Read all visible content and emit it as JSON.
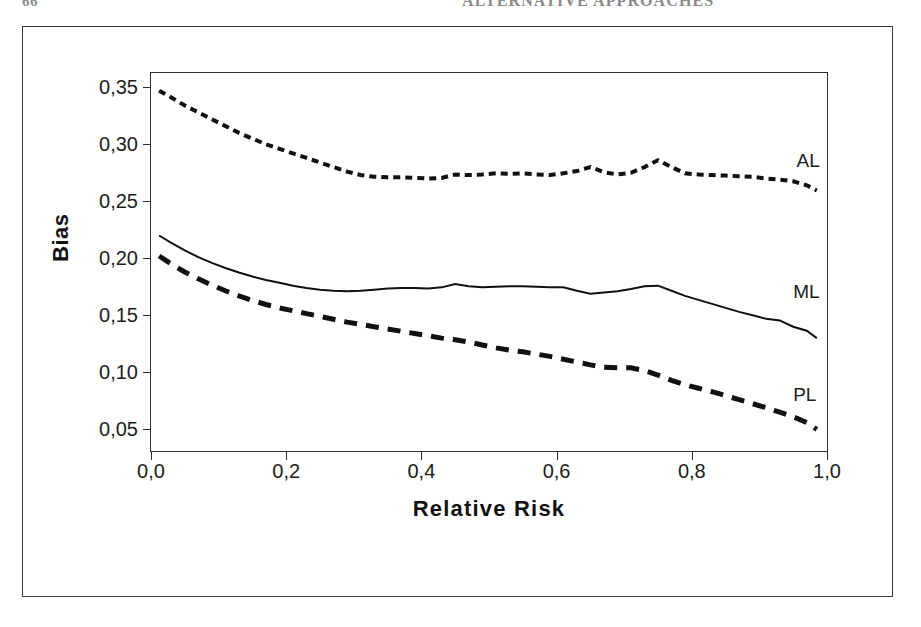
{
  "page": {
    "folio": "66",
    "running_head": "ALTERNATIVE APPROACHES"
  },
  "chart_data": {
    "type": "line",
    "title": "",
    "xlabel": "Relative Risk",
    "ylabel": "Bias",
    "xlim": [
      0.0,
      1.0
    ],
    "ylim": [
      0.031,
      0.3625
    ],
    "grid": false,
    "legend_position": "inline-right-of-curve",
    "xtick_labels": [
      "0,0",
      "0,2",
      "0,4",
      "0,6",
      "0,8",
      "1,0"
    ],
    "xtick_values": [
      0.0,
      0.2,
      0.4,
      0.6,
      0.8,
      1.0
    ],
    "ytick_labels": [
      "0,05",
      "0,10",
      "0,15",
      "0,20",
      "0,25",
      "0,30",
      "0,35"
    ],
    "ytick_values": [
      0.05,
      0.1,
      0.15,
      0.2,
      0.25,
      0.3,
      0.35
    ],
    "decimal_separator": ",",
    "series": [
      {
        "name": "AL",
        "label": "AL",
        "style": "dotted",
        "color": "#111111",
        "width": 4.0,
        "dash": "7,5",
        "label_x": 0.955,
        "label_y": 0.2855,
        "x": [
          0.012,
          0.03,
          0.05,
          0.07,
          0.09,
          0.11,
          0.13,
          0.15,
          0.17,
          0.19,
          0.21,
          0.23,
          0.25,
          0.27,
          0.29,
          0.31,
          0.33,
          0.35,
          0.37,
          0.39,
          0.41,
          0.43,
          0.45,
          0.47,
          0.49,
          0.51,
          0.53,
          0.55,
          0.57,
          0.59,
          0.61,
          0.63,
          0.65,
          0.67,
          0.69,
          0.71,
          0.73,
          0.75,
          0.77,
          0.79,
          0.81,
          0.83,
          0.85,
          0.87,
          0.89,
          0.91,
          0.93,
          0.95,
          0.97,
          0.985
        ],
        "y": [
          0.347,
          0.341,
          0.334,
          0.328,
          0.322,
          0.316,
          0.31,
          0.305,
          0.3,
          0.296,
          0.292,
          0.288,
          0.284,
          0.28,
          0.276,
          0.273,
          0.2715,
          0.271,
          0.271,
          0.2705,
          0.27,
          0.2705,
          0.2735,
          0.273,
          0.2735,
          0.2745,
          0.274,
          0.2745,
          0.2735,
          0.273,
          0.2745,
          0.2765,
          0.28,
          0.2755,
          0.2735,
          0.275,
          0.28,
          0.286,
          0.28,
          0.2745,
          0.2735,
          0.273,
          0.2725,
          0.272,
          0.2715,
          0.27,
          0.269,
          0.2675,
          0.264,
          0.2595
        ]
      },
      {
        "name": "ML",
        "label": "ML",
        "style": "solid",
        "color": "#111111",
        "width": 2.0,
        "dash": "none",
        "label_x": 0.95,
        "label_y": 0.1705,
        "x": [
          0.012,
          0.03,
          0.05,
          0.07,
          0.09,
          0.11,
          0.13,
          0.15,
          0.17,
          0.19,
          0.21,
          0.23,
          0.25,
          0.27,
          0.29,
          0.31,
          0.33,
          0.35,
          0.37,
          0.39,
          0.41,
          0.43,
          0.45,
          0.47,
          0.49,
          0.51,
          0.53,
          0.55,
          0.57,
          0.59,
          0.61,
          0.63,
          0.65,
          0.67,
          0.69,
          0.71,
          0.73,
          0.75,
          0.77,
          0.79,
          0.81,
          0.83,
          0.85,
          0.87,
          0.89,
          0.91,
          0.93,
          0.95,
          0.97,
          0.985
        ],
        "y": [
          0.22,
          0.2135,
          0.207,
          0.201,
          0.196,
          0.1915,
          0.1875,
          0.184,
          0.181,
          0.1785,
          0.176,
          0.174,
          0.1725,
          0.1715,
          0.171,
          0.1715,
          0.1725,
          0.1735,
          0.174,
          0.174,
          0.1735,
          0.1745,
          0.1775,
          0.1755,
          0.1745,
          0.175,
          0.1755,
          0.1755,
          0.175,
          0.1745,
          0.1745,
          0.1715,
          0.169,
          0.17,
          0.171,
          0.173,
          0.1755,
          0.176,
          0.1715,
          0.167,
          0.1635,
          0.16,
          0.1565,
          0.153,
          0.15,
          0.147,
          0.1455,
          0.14,
          0.1365,
          0.13
        ]
      },
      {
        "name": "PL",
        "label": "PL",
        "style": "dashed",
        "color": "#111111",
        "width": 5.0,
        "dash": "13,9",
        "label_x": 0.95,
        "label_y": 0.08,
        "x": [
          0.012,
          0.03,
          0.05,
          0.07,
          0.09,
          0.11,
          0.13,
          0.15,
          0.17,
          0.19,
          0.21,
          0.23,
          0.25,
          0.27,
          0.29,
          0.31,
          0.33,
          0.35,
          0.37,
          0.39,
          0.41,
          0.43,
          0.45,
          0.47,
          0.49,
          0.51,
          0.53,
          0.55,
          0.57,
          0.59,
          0.61,
          0.63,
          0.65,
          0.67,
          0.69,
          0.71,
          0.73,
          0.75,
          0.77,
          0.79,
          0.81,
          0.83,
          0.85,
          0.87,
          0.89,
          0.91,
          0.93,
          0.95,
          0.97,
          0.985
        ],
        "y": [
          0.202,
          0.195,
          0.188,
          0.182,
          0.1765,
          0.1715,
          0.167,
          0.163,
          0.1595,
          0.1565,
          0.154,
          0.1515,
          0.149,
          0.1465,
          0.144,
          0.142,
          0.14,
          0.138,
          0.136,
          0.134,
          0.132,
          0.13,
          0.1285,
          0.1265,
          0.124,
          0.1215,
          0.1195,
          0.118,
          0.116,
          0.114,
          0.1115,
          0.109,
          0.1065,
          0.1045,
          0.104,
          0.104,
          0.1015,
          0.0975,
          0.093,
          0.089,
          0.086,
          0.083,
          0.0795,
          0.076,
          0.0725,
          0.069,
          0.065,
          0.061,
          0.056,
          0.05
        ]
      }
    ]
  }
}
